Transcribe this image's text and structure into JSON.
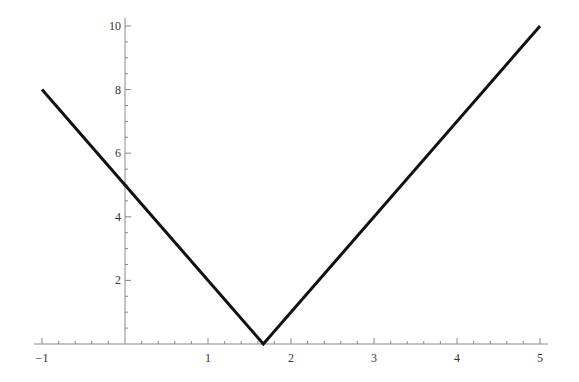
{
  "chart_data": {
    "type": "line",
    "title": "",
    "xlabel": "",
    "ylabel": "",
    "xlim": [
      -1,
      5
    ],
    "ylim": [
      0,
      10
    ],
    "grid": false,
    "legend": null,
    "x_ticks": [
      -1,
      1,
      2,
      3,
      4,
      5
    ],
    "y_ticks": [
      2,
      4,
      6,
      8,
      10
    ],
    "x_minor_step": 0.2,
    "y_minor_step": 0.5,
    "series": [
      {
        "name": "|3x - 5|",
        "x": [
          -1,
          0,
          1.6667,
          5
        ],
        "y": [
          8,
          5,
          0,
          10
        ],
        "color": "#111111"
      }
    ]
  },
  "axes": {
    "x_tick_labels": [
      "−1",
      "1",
      "2",
      "3",
      "4",
      "5"
    ],
    "y_tick_labels": [
      "2",
      "4",
      "6",
      "8",
      "10"
    ]
  }
}
